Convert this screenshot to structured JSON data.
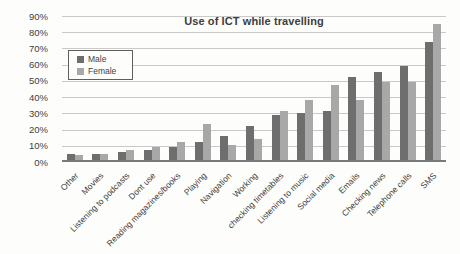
{
  "chart": {
    "title": "Use of ICT while travelling",
    "colors": {
      "male_bar": "#6e6e6e",
      "female_bar": "#a8a8a8",
      "gridline": "#c9c9c9",
      "axis_line": "#7a7a7a",
      "text": "#3f3f3f"
    }
  },
  "chart_data": {
    "type": "bar",
    "title": "Use of ICT while travelling",
    "categories": [
      "Other",
      "Movies",
      "Listening to podcasts",
      "Dont use",
      "Reading magazines/books",
      "Playing",
      "Navigation",
      "Working",
      "checking timetables",
      "Listening to music",
      "Social media",
      "Emails",
      "Checking news",
      "Telephone calls",
      "SMS"
    ],
    "series": [
      {
        "name": "Male",
        "color": "#6e6e6e",
        "values": [
          4,
          4,
          5,
          6,
          8,
          11,
          15,
          21,
          28,
          29,
          30,
          51,
          54,
          58,
          73
        ]
      },
      {
        "name": "Female",
        "color": "#a8a8a8",
        "values": [
          3,
          4,
          6,
          8,
          11,
          22,
          9,
          13,
          30,
          37,
          46,
          37,
          48,
          48,
          84
        ]
      }
    ],
    "xlabel": "",
    "ylabel": "",
    "ylim": [
      0,
      90
    ],
    "ytick_step": 10,
    "yticks": [
      "0%",
      "10%",
      "20%",
      "30%",
      "40%",
      "50%",
      "60%",
      "70%",
      "80%",
      "90%"
    ],
    "grid": true,
    "legend_position": "upper-left-inside",
    "x_label_rotation": -45
  }
}
